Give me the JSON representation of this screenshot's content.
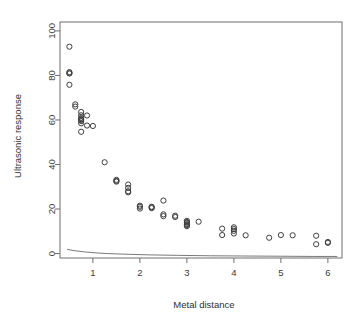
{
  "chart_data": {
    "type": "scatter",
    "title": "",
    "xlabel": "Metal distance",
    "ylabel": "Ultrasonic response",
    "xlim": [
      0.3,
      6.3
    ],
    "ylim": [
      -2,
      104
    ],
    "xticks": [
      1,
      2,
      3,
      4,
      5,
      6
    ],
    "yticks": [
      0,
      20,
      40,
      60,
      80,
      100
    ],
    "xtick_labels": [
      "1",
      "2",
      "3",
      "4",
      "5",
      "6"
    ],
    "ytick_labels": [
      "0",
      "20",
      "40",
      "60",
      "80",
      "100"
    ],
    "grid": false,
    "legend": "none",
    "point_marker": "open-circle",
    "series": [
      {
        "name": "Ultrasonic response vs metal distance",
        "x": [
          0.5,
          0.5,
          0.5,
          0.5,
          0.5,
          0.625,
          0.625,
          0.75,
          0.75,
          0.75,
          0.75,
          0.75,
          0.75,
          0.75,
          0.75,
          0.875,
          0.875,
          1.0,
          1.25,
          1.5,
          1.5,
          1.5,
          1.75,
          1.75,
          1.75,
          1.75,
          2.0,
          2.0,
          2.0,
          2.25,
          2.25,
          2.25,
          2.5,
          2.5,
          2.5,
          2.75,
          2.75,
          3.0,
          3.0,
          3.0,
          3.0,
          3.0,
          3.0,
          3.25,
          3.75,
          3.75,
          4.0,
          4.0,
          4.0,
          4.0,
          4.25,
          4.75,
          5.0,
          5.25,
          5.75,
          5.75,
          6.0,
          6.0
        ],
        "y": [
          92.9,
          81.5,
          81.0,
          80.9,
          75.8,
          67.0,
          66.0,
          63.6,
          62.1,
          61.0,
          60.4,
          60.0,
          59.5,
          58.5,
          54.7,
          62.0,
          57.5,
          57.3,
          41.0,
          33.1,
          32.6,
          32.3,
          31.0,
          29.5,
          28.0,
          27.5,
          21.5,
          21.0,
          20.2,
          21.0,
          20.8,
          20.4,
          23.8,
          17.6,
          16.8,
          17.0,
          16.4,
          14.7,
          14.2,
          13.8,
          13.2,
          12.8,
          12.3,
          14.3,
          11.2,
          8.3,
          11.8,
          11.0,
          10.2,
          9.0,
          8.2,
          7.1,
          8.3,
          8.2,
          8.0,
          4.2,
          5.2,
          4.8
        ],
        "count": 58
      }
    ],
    "fit_curve": {
      "name": "fitted baseline curve",
      "x": [
        0.45,
        0.6,
        0.8,
        1.0,
        1.3,
        1.7,
        2.2,
        2.8,
        3.5,
        4.2,
        5.0,
        5.7,
        6.2
      ],
      "y": [
        1.9,
        1.3,
        0.8,
        0.4,
        0.0,
        -0.3,
        -0.6,
        -0.8,
        -1.0,
        -1.1,
        -1.2,
        -1.3,
        -1.3
      ]
    }
  },
  "colors": {
    "background": "#ffffff",
    "axis": "#6e6e6e",
    "point_stroke": "#3f3f3f",
    "curve": "#7a7a7a",
    "text": "#2e2e2e"
  }
}
